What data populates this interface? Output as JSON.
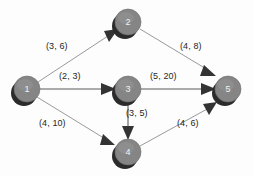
{
  "diagram": {
    "type": "directed-graph",
    "background_color": "#fdfdfd",
    "node_color": "#858585",
    "node_shadow_color": "#2b2b2b",
    "node_label_color": "#f2f2f2",
    "edge_color": "#9a9a9a",
    "arrow_color": "#333333",
    "label_color": "#262626",
    "nodes": [
      {
        "id": "1",
        "label": "1",
        "cx": 27,
        "cy": 89,
        "r": 13
      },
      {
        "id": "2",
        "label": "2",
        "cx": 128,
        "cy": 22,
        "r": 13
      },
      {
        "id": "3",
        "label": "3",
        "cx": 128,
        "cy": 89,
        "r": 13
      },
      {
        "id": "4",
        "label": "4",
        "cx": 128,
        "cy": 152,
        "r": 13
      },
      {
        "id": "5",
        "label": "5",
        "cx": 228,
        "cy": 89,
        "r": 13
      }
    ],
    "edges": [
      {
        "from": "1",
        "to": "2",
        "label": "(3, 6)",
        "label_x": 46,
        "label_y": 41
      },
      {
        "from": "1",
        "to": "3",
        "label": "(2, 3)",
        "label_x": 59,
        "label_y": 71
      },
      {
        "from": "1",
        "to": "4",
        "label": "(4, 10)",
        "label_x": 39,
        "label_y": 118
      },
      {
        "from": "2",
        "to": "5",
        "label": "(4, 8)",
        "label_x": 180,
        "label_y": 41
      },
      {
        "from": "3",
        "to": "5",
        "label": "(5, 20)",
        "label_x": 150,
        "label_y": 71
      },
      {
        "from": "3",
        "to": "4",
        "label": "(3, 5)",
        "label_x": 126,
        "label_y": 108
      },
      {
        "from": "4",
        "to": "5",
        "label": "(4, 6)",
        "label_x": 177,
        "label_y": 118
      }
    ]
  }
}
